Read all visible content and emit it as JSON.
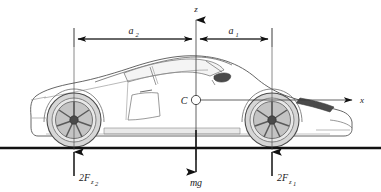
{
  "figure": {
    "type": "free-body-diagram"
  },
  "axes": {
    "origin_label": "C",
    "vertical_axis_label": "z",
    "horizontal_axis_label": "x",
    "origin_px": {
      "x": 196,
      "y": 100
    }
  },
  "dimensions": [
    {
      "name": "rear-distance",
      "label": "a",
      "subscript": "2",
      "from_px": 74,
      "to_px": 196,
      "y_px": 39,
      "side": "rear"
    },
    {
      "name": "front-distance",
      "label": "a",
      "subscript": "1",
      "from_px": 196,
      "to_px": 272,
      "y_px": 39,
      "side": "front"
    }
  ],
  "forces": [
    {
      "name": "rear-axle-normal-force",
      "label": "2F",
      "subscript": "z",
      "subsubscript": "2",
      "direction": "up",
      "x_px": 74,
      "magnitude_text": "2F_z2"
    },
    {
      "name": "weight",
      "label": "mg",
      "subscript": "",
      "subsubscript": "",
      "direction": "down",
      "x_px": 196,
      "magnitude_text": "mg"
    },
    {
      "name": "front-axle-normal-force",
      "label": "2F",
      "subscript": "z",
      "subsubscript": "1",
      "direction": "up",
      "x_px": 272,
      "magnitude_text": "2F_z1"
    }
  ],
  "ground": {
    "name": "road-surface",
    "y_px": 148
  },
  "colors": {
    "ink": "#1a1a1a",
    "line": "#111111",
    "car_outline": "#555555",
    "tyre_fill": "#d8d8d8",
    "rim_fill": "#bdbdbd",
    "hub": "#4a4a4a",
    "glass": "#f2f2f2",
    "background": "#ffffff",
    "thin_line": "#6a6a6a"
  }
}
